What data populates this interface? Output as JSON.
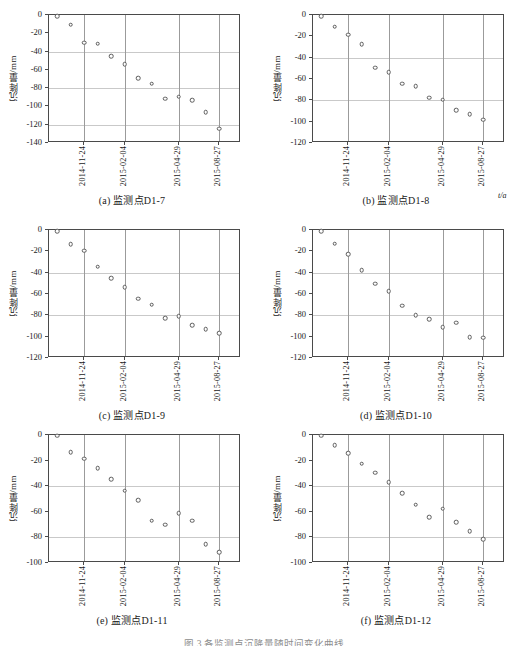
{
  "figure": {
    "unit_label": "t/a",
    "bottom_caption": "图 3  各监测点沉降量随时间变化曲线",
    "y_axis_label": "沉降量/mm",
    "x_tick_labels": [
      "2014-11-24",
      "2015-02-04",
      "2015-04-29",
      "2015-08-27"
    ]
  },
  "chart_data": [
    {
      "type": "scatter",
      "panel": "a",
      "caption": "(a) 监测点D1-7",
      "title": "",
      "xlabel": "",
      "ylabel": "沉降量/mm",
      "unit": "t/a",
      "xtick_labels": [
        "2014-11-24",
        "2015-02-04",
        "2015-04-29",
        "2015-08-27"
      ],
      "xtick_positions": [
        2,
        5,
        9,
        12
      ],
      "ylim": [
        -140,
        0
      ],
      "yticks": [
        0,
        -20,
        -40,
        -60,
        -80,
        -100,
        -120,
        -140
      ],
      "grid": true,
      "x": [
        0,
        1,
        2,
        3,
        4,
        5,
        6,
        7,
        8,
        9,
        10,
        11,
        12,
        13
      ],
      "values": [
        -1,
        -10.5,
        -30.5,
        -31.5,
        -45,
        -54,
        -69,
        -75,
        -91.5,
        -89.5,
        -93,
        -106,
        -124.5,
        null
      ]
    },
    {
      "type": "scatter",
      "panel": "b",
      "caption": "(b) 监测点D1-8",
      "title": "",
      "xlabel": "",
      "ylabel": "沉降量/mm",
      "unit": "t/a",
      "xtick_labels": [
        "2014-11-24",
        "2015-02-04",
        "2015-04-29",
        "2015-08-27"
      ],
      "xtick_positions": [
        2,
        5,
        9,
        12
      ],
      "ylim": [
        -120,
        0
      ],
      "yticks": [
        0,
        -20,
        -40,
        -60,
        -80,
        -100,
        -120
      ],
      "grid": true,
      "x": [
        0,
        1,
        2,
        3,
        4,
        5,
        6,
        7,
        8,
        9,
        10,
        11,
        12,
        13
      ],
      "values": [
        -1,
        -11,
        -18.5,
        -27.5,
        -49.5,
        -53.5,
        -64.5,
        -66.5,
        -77.5,
        -79.5,
        -89.5,
        -93,
        -98,
        null
      ]
    },
    {
      "type": "scatter",
      "panel": "c",
      "caption": "(c) 监测点D1-9",
      "title": "",
      "xlabel": "",
      "ylabel": "沉降量/mm",
      "unit": "t/a",
      "xtick_labels": [
        "2014-11-24",
        "2015-02-04",
        "2015-04-29",
        "2015-08-27"
      ],
      "xtick_positions": [
        2,
        5,
        9,
        12
      ],
      "ylim": [
        -120,
        0
      ],
      "yticks": [
        0,
        -20,
        -40,
        -60,
        -80,
        -100,
        -120
      ],
      "grid": true,
      "x": [
        0,
        1,
        2,
        3,
        4,
        5,
        6,
        7,
        8,
        9,
        10,
        11,
        12,
        13
      ],
      "values": [
        -1,
        -13.5,
        -19.5,
        -34.5,
        -45,
        -53.5,
        -64.5,
        -70,
        -82.5,
        -81,
        -89,
        -93,
        -97,
        null
      ]
    },
    {
      "type": "scatter",
      "panel": "d",
      "caption": "(d) 监测点D1-10",
      "title": "",
      "xlabel": "",
      "ylabel": "沉降量/mm",
      "unit": "t/a",
      "xtick_labels": [
        "2014-11-24",
        "2015-02-04",
        "2015-04-29",
        "2015-08-27"
      ],
      "xtick_positions": [
        2,
        5,
        9,
        12
      ],
      "ylim": [
        -120,
        0
      ],
      "yticks": [
        0,
        -20,
        -40,
        -60,
        -80,
        -100,
        -120
      ],
      "grid": true,
      "x": [
        0,
        1,
        2,
        3,
        4,
        5,
        6,
        7,
        8,
        9,
        10,
        11,
        12,
        13
      ],
      "values": [
        -1,
        -13,
        -22.5,
        -37.5,
        -50.5,
        -57.5,
        -71,
        -80,
        -83.5,
        -91,
        -87,
        -100.5,
        -101,
        null
      ]
    },
    {
      "type": "scatter",
      "panel": "e",
      "caption": "(e) 监测点D1-11",
      "title": "",
      "xlabel": "",
      "ylabel": "沉降量/mm",
      "unit": "t/a",
      "xtick_labels": [
        "2014-11-24",
        "2015-02-04",
        "2015-04-29",
        "2015-08-27"
      ],
      "xtick_positions": [
        2,
        5,
        9,
        12
      ],
      "ylim": [
        -100,
        0
      ],
      "yticks": [
        0,
        -20,
        -40,
        -60,
        -80,
        -100
      ],
      "grid": true,
      "x": [
        0,
        1,
        2,
        3,
        4,
        5,
        6,
        7,
        8,
        9,
        10,
        11,
        12,
        13
      ],
      "values": [
        -0.5,
        -13.5,
        -18.5,
        -26,
        -34.5,
        -43.5,
        -51,
        -67,
        -70,
        -61,
        -67,
        -85.5,
        -91.5,
        null
      ]
    },
    {
      "type": "scatter",
      "panel": "f",
      "caption": "(f) 监测点D1-12",
      "title": "",
      "xlabel": "",
      "ylabel": "沉降量/mm",
      "unit": "t/a",
      "xtick_labels": [
        "2014-11-24",
        "2015-02-04",
        "2015-04-29",
        "2015-08-27"
      ],
      "xtick_positions": [
        2,
        5,
        9,
        12
      ],
      "ylim": [
        -100,
        0
      ],
      "yticks": [
        0,
        -20,
        -40,
        -60,
        -80,
        -100
      ],
      "grid": true,
      "x": [
        0,
        1,
        2,
        3,
        4,
        5,
        6,
        7,
        8,
        9,
        10,
        11,
        12,
        13
      ],
      "values": [
        -0.5,
        -8,
        -14,
        -22.5,
        -29.5,
        -37,
        -45.5,
        -54.5,
        -64,
        -57.5,
        -68,
        -75,
        -81.5,
        null
      ]
    }
  ]
}
